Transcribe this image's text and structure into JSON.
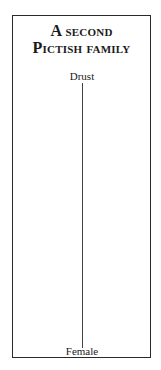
{
  "title": {
    "line1": "A second",
    "line2": "Pictish family"
  },
  "tree": {
    "root": "Drust",
    "child": "Female"
  }
}
